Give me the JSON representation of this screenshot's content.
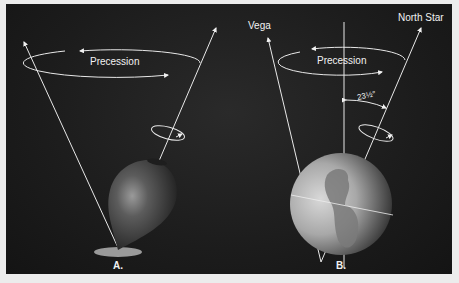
{
  "figure": {
    "panel_a": {
      "label": "A.",
      "precession_label": "Precession",
      "object": "spinning top"
    },
    "panel_b": {
      "label": "B.",
      "precession_label": "Precession",
      "object": "Earth",
      "star_left": "Vega",
      "star_right": "North Star",
      "tilt_angle": "23½°"
    },
    "colors": {
      "background": "#1c1c1c",
      "lines": "#e8e8e8",
      "text": "#f2f2f2",
      "frame": "#ececec"
    }
  }
}
